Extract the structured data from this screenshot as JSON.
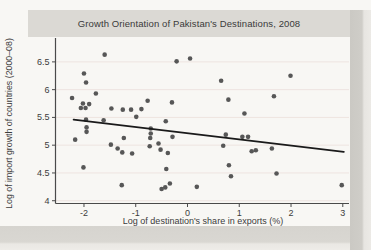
{
  "figure": {
    "title": "Growth Orientation of Pakistan's Destinations, 2008"
  },
  "chart_data": {
    "type": "scatter",
    "title": "Growth Orientation of Pakistan's Destinations, 2008",
    "xlabel": "Log of destination's share in exports (%)",
    "ylabel": "Log of import growth of countries (2000–08)",
    "xlim": [
      -2.55,
      3.12
    ],
    "ylim": [
      3.95,
      6.93
    ],
    "x_ticks": [
      -2,
      -1,
      0,
      1,
      2,
      3
    ],
    "x_tick_labels": [
      "-2",
      "-1",
      "0",
      "1",
      "2",
      "3"
    ],
    "y_ticks": [
      4,
      4.5,
      5,
      5.5,
      6,
      6.5
    ],
    "y_tick_labels": [
      "4",
      "4.5",
      "5",
      "5.5",
      "6",
      "6.5"
    ],
    "grid": "horizontal-faint",
    "legend": "none",
    "trend_line": {
      "x1": -2.2,
      "y1": 5.46,
      "x2": 3.02,
      "y2": 4.88
    },
    "points": [
      [
        -1.6,
        6.63
      ],
      [
        -0.21,
        6.51
      ],
      [
        0.05,
        6.56
      ],
      [
        -2.0,
        6.29
      ],
      [
        -1.96,
        6.13
      ],
      [
        0.65,
        6.16
      ],
      [
        1.99,
        6.25
      ],
      [
        -2.23,
        5.85
      ],
      [
        -1.77,
        5.93
      ],
      [
        -2.02,
        5.75
      ],
      [
        -1.9,
        5.74
      ],
      [
        -2.06,
        5.67
      ],
      [
        -1.97,
        5.67
      ],
      [
        -1.47,
        5.66
      ],
      [
        -1.25,
        5.64
      ],
      [
        -1.09,
        5.64
      ],
      [
        -0.89,
        5.65
      ],
      [
        -0.77,
        5.8
      ],
      [
        -0.3,
        5.77
      ],
      [
        -0.99,
        5.51
      ],
      [
        -0.42,
        5.43
      ],
      [
        0.79,
        5.82
      ],
      [
        1.67,
        5.88
      ],
      [
        1.1,
        5.57
      ],
      [
        -1.96,
        5.46
      ],
      [
        -1.62,
        5.45
      ],
      [
        -1.95,
        5.32
      ],
      [
        -1.95,
        5.24
      ],
      [
        -0.71,
        5.3
      ],
      [
        -0.71,
        5.21
      ],
      [
        -0.72,
        5.13
      ],
      [
        -0.29,
        5.15
      ],
      [
        -2.17,
        5.1
      ],
      [
        -1.23,
        5.13
      ],
      [
        -1.48,
        5.01
      ],
      [
        -1.35,
        4.94
      ],
      [
        -1.26,
        4.87
      ],
      [
        -1.07,
        4.85
      ],
      [
        -0.73,
        4.98
      ],
      [
        -0.56,
        5.03
      ],
      [
        -0.52,
        4.92
      ],
      [
        -0.38,
        4.86
      ],
      [
        0.74,
        5.19
      ],
      [
        1.06,
        5.15
      ],
      [
        1.17,
        5.15
      ],
      [
        0.69,
        4.99
      ],
      [
        1.24,
        4.89
      ],
      [
        1.32,
        4.91
      ],
      [
        1.63,
        4.94
      ],
      [
        -2.01,
        4.6
      ],
      [
        -0.41,
        4.57
      ],
      [
        0.8,
        4.64
      ],
      [
        -1.27,
        4.28
      ],
      [
        -0.5,
        4.21
      ],
      [
        -0.43,
        4.24
      ],
      [
        -0.34,
        4.31
      ],
      [
        0.18,
        4.25
      ],
      [
        0.84,
        4.44
      ],
      [
        1.72,
        4.49
      ],
      [
        2.98,
        4.28
      ]
    ],
    "colors": {
      "dot": "#575757",
      "trend": "#1a1a1a",
      "grid": "#eee4e0",
      "axis": "#4a4a4a",
      "text": "#3c3c3c",
      "title_band": "#dbd9d4",
      "plot_bg": "#f8f7f4"
    }
  }
}
